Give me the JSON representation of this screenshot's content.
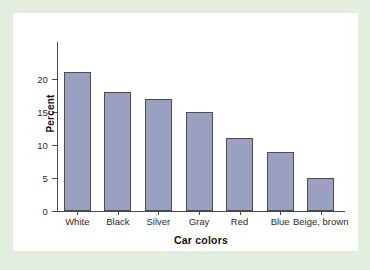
{
  "figure": {
    "background_color": "#e2efdf",
    "panel_color": "#ffffff"
  },
  "chart_data": {
    "type": "bar",
    "title": "",
    "subtitle": "",
    "xlabel": "Car colors",
    "ylabel": "Percent",
    "categories": [
      "White",
      "Black",
      "Silver",
      "Gray",
      "Red",
      "Blue",
      "Beige, brown"
    ],
    "values": [
      21,
      18,
      17,
      15,
      11,
      9,
      5
    ],
    "ylim": [
      0,
      22
    ],
    "yticks": [
      0,
      5,
      10,
      15,
      20
    ],
    "ytick_labels": [
      "0",
      "5",
      "10",
      "15",
      "20"
    ],
    "grid": false,
    "legend": null,
    "bar_fill_color": "#9aa0bf",
    "bar_edge_color": "#4b4b55",
    "axis_color": "#4a4a4a"
  }
}
